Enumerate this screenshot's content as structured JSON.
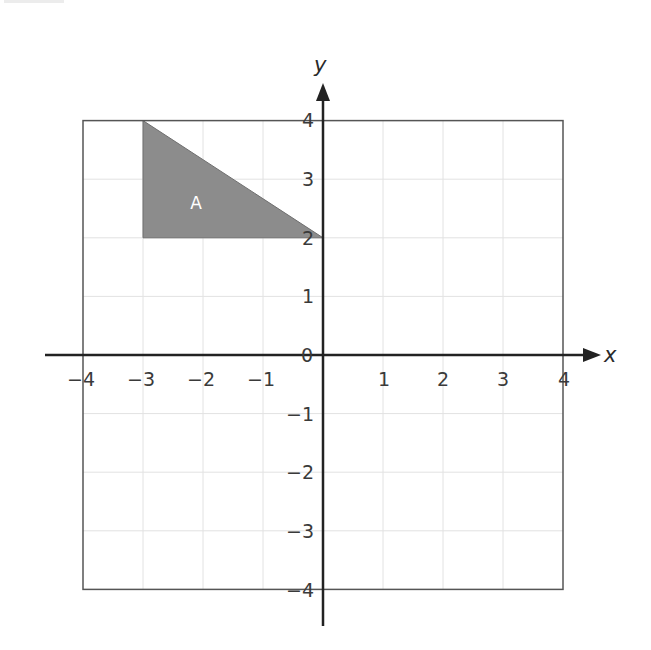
{
  "diagram": {
    "type": "coordinate-grid",
    "axes": {
      "x_label": "x",
      "y_label": "y",
      "x_range": [
        -4,
        4
      ],
      "y_range": [
        -4,
        4
      ],
      "origin_label": "0",
      "x_ticks": [
        {
          "value": -4,
          "label": "−4"
        },
        {
          "value": -3,
          "label": "−3"
        },
        {
          "value": -2,
          "label": "−2"
        },
        {
          "value": -1,
          "label": "−1"
        },
        {
          "value": 1,
          "label": "1"
        },
        {
          "value": 2,
          "label": "2"
        },
        {
          "value": 3,
          "label": "3"
        },
        {
          "value": 4,
          "label": "4"
        }
      ],
      "y_ticks": [
        {
          "value": 4,
          "label": "4"
        },
        {
          "value": 3,
          "label": "3"
        },
        {
          "value": 2,
          "label": "2"
        },
        {
          "value": 1,
          "label": "1"
        },
        {
          "value": -1,
          "label": "−1"
        },
        {
          "value": -2,
          "label": "−2"
        },
        {
          "value": -3,
          "label": "−3"
        },
        {
          "value": -4,
          "label": "−4"
        }
      ]
    },
    "shapes": [
      {
        "name": "A",
        "label": "A",
        "type": "triangle",
        "vertices": [
          [
            -3,
            4
          ],
          [
            -3,
            2
          ],
          [
            0,
            2
          ]
        ],
        "fill": "#8c8c8c"
      }
    ],
    "colors": {
      "grid": "#e2e2e2",
      "border": "#555555",
      "axis": "#222222",
      "shape_fill": "#8c8c8c",
      "shape_label": "#ffffff"
    }
  }
}
